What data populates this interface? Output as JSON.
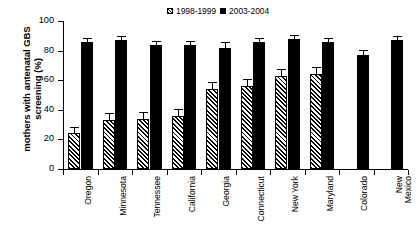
{
  "chart_data": {
    "type": "bar",
    "title": "",
    "xlabel": "",
    "ylabel_line1": "mothers with antenatal GBS",
    "ylabel_line2": "screening (%)",
    "ylim": [
      0,
      100
    ],
    "yticks": [
      0,
      20,
      40,
      60,
      80,
      100
    ],
    "grid": false,
    "legend_position": "top-center",
    "categories": [
      "Oregon",
      "Minnesota",
      "Tennessee",
      "California",
      "Georgia",
      "Connecticut",
      "New York",
      "Maryland",
      "Colorado",
      "New\nMexico"
    ],
    "series": [
      {
        "name": "1998-1999",
        "fill": "hatched",
        "color": "#000000",
        "values": [
          24,
          33,
          34,
          36,
          54,
          56,
          63,
          64,
          null,
          null
        ],
        "errors": [
          4,
          4,
          4,
          4,
          4,
          4,
          4,
          4,
          null,
          null
        ]
      },
      {
        "name": "2003-2004",
        "fill": "solid",
        "color": "#000000",
        "values": [
          86,
          87,
          84,
          84,
          82,
          86,
          88,
          86,
          77,
          87
        ],
        "errors": [
          2,
          2,
          2,
          2,
          3,
          2,
          2,
          2,
          3,
          2
        ]
      }
    ]
  },
  "legend": {
    "items": [
      {
        "label": "1998-1999",
        "swatch": "hatched-swatch"
      },
      {
        "label": "2003-2004",
        "swatch": "solid-swatch"
      }
    ]
  }
}
